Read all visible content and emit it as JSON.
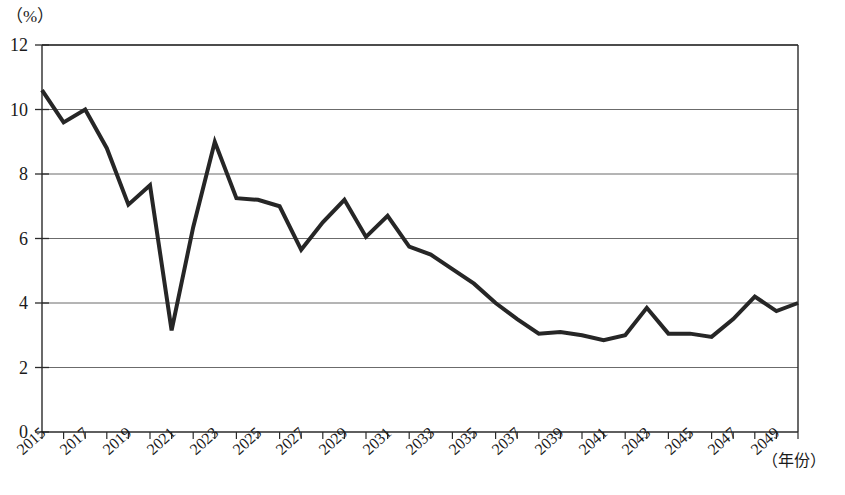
{
  "chart_data": {
    "type": "line",
    "title": "",
    "subtitle": "",
    "xlabel": "（年份）",
    "ylabel": "（%）",
    "ylim": [
      0,
      12
    ],
    "xlim": [
      2015,
      2050
    ],
    "grid": true,
    "legend": null,
    "y_ticks": [
      "0",
      "2",
      "4",
      "6",
      "8",
      "10",
      "12"
    ],
    "y_tick_values": [
      0,
      2,
      4,
      6,
      8,
      10,
      12
    ],
    "x_ticks": [
      "2015",
      "2017",
      "2019",
      "2021",
      "2023",
      "2025",
      "2027",
      "2029",
      "2031",
      "2033",
      "2035",
      "2037",
      "2039",
      "2041",
      "2043",
      "2045",
      "2047",
      "2049"
    ],
    "x_tick_values": [
      2015,
      2017,
      2019,
      2021,
      2023,
      2025,
      2027,
      2029,
      2031,
      2033,
      2035,
      2037,
      2039,
      2041,
      2043,
      2045,
      2047,
      2049
    ],
    "line_color": "#262626",
    "line_width": 4,
    "x": [
      2015,
      2016,
      2017,
      2018,
      2019,
      2020,
      2021,
      2022,
      2023,
      2024,
      2025,
      2026,
      2027,
      2028,
      2029,
      2030,
      2031,
      2032,
      2033,
      2034,
      2035,
      2036,
      2037,
      2038,
      2039,
      2040,
      2041,
      2042,
      2043,
      2044,
      2045,
      2046,
      2047,
      2048,
      2049,
      2050
    ],
    "values": [
      10.6,
      9.6,
      10.0,
      8.8,
      7.05,
      7.65,
      3.15,
      6.35,
      9.0,
      7.25,
      7.2,
      7.0,
      5.65,
      6.5,
      7.2,
      6.05,
      6.7,
      5.75,
      5.5,
      5.05,
      4.6,
      4.0,
      3.5,
      3.05,
      3.1,
      3.0,
      2.85,
      3.0,
      3.85,
      3.05,
      3.05,
      2.95,
      3.5,
      4.2,
      3.75,
      4.0
    ],
    "series": [
      {
        "name": "增长率",
        "values": [
          10.6,
          9.6,
          10.0,
          8.8,
          7.05,
          7.65,
          3.15,
          6.35,
          9.0,
          7.25,
          7.2,
          7.0,
          5.65,
          6.5,
          7.2,
          6.05,
          6.7,
          5.75,
          5.5,
          5.05,
          4.6,
          4.0,
          3.5,
          3.05,
          3.1,
          3.0,
          2.85,
          3.0,
          3.85,
          3.05,
          3.05,
          2.95,
          3.5,
          4.2,
          3.75,
          4.0
        ]
      }
    ]
  }
}
